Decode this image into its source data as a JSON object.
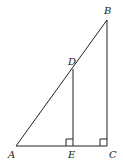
{
  "diagram": {
    "type": "geometry",
    "points": {
      "A": {
        "label": "A",
        "x": 16,
        "y": 146
      },
      "B": {
        "label": "B",
        "x": 107,
        "y": 20
      },
      "C": {
        "label": "C",
        "x": 107,
        "y": 146
      },
      "D": {
        "label": "D",
        "x": 73,
        "y": 69
      },
      "E": {
        "label": "E",
        "x": 73,
        "y": 146
      }
    },
    "segments": [
      "AB",
      "BC",
      "AC",
      "DE"
    ],
    "right_angles": [
      "E",
      "C"
    ],
    "colors": {
      "stroke": "#222222",
      "background": "#ffffff"
    }
  }
}
